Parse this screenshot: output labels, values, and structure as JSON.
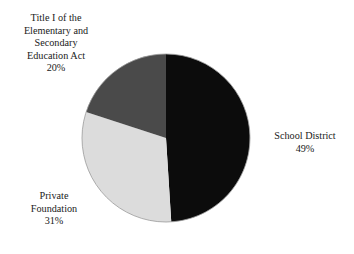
{
  "chart_data": {
    "type": "pie",
    "title": "",
    "subtitle": "",
    "xlabel": "",
    "ylabel": "",
    "legend_position": "none",
    "grid": false,
    "start_angle_deg": 0,
    "direction": "clockwise",
    "units": "percent",
    "categories": [
      "School District",
      "Private Foundation",
      "Title I of the Elementary and Secondary Education Act"
    ],
    "values": [
      49,
      31,
      20
    ],
    "slice_colors": [
      "#0c0c0c",
      "#dcdcdc",
      "#4a4a4a"
    ],
    "slices": [
      {
        "name": "School District",
        "value": 49,
        "value_label": "49%",
        "color": "#0c0c0c",
        "label_lines": [
          "School District"
        ]
      },
      {
        "name": "Private Foundation",
        "value": 31,
        "value_label": "31%",
        "color": "#dcdcdc",
        "label_lines": [
          "Private",
          "Foundation"
        ]
      },
      {
        "name": "Title I of the Elementary and Secondary Education Act",
        "value": 20,
        "value_label": "20%",
        "color": "#4a4a4a",
        "label_lines": [
          "Title I of the",
          "Elementary and",
          "Secondary",
          "Education Act"
        ]
      }
    ]
  },
  "labels": {
    "title1": {
      "line1": "Title I of the",
      "line2": "Elementary and",
      "line3": "Secondary",
      "line4": "Education Act",
      "percent": "20%"
    },
    "school_district": {
      "line1": "School District",
      "percent": "49%"
    },
    "private_foundation": {
      "line1": "Private",
      "line2": "Foundation",
      "percent": "31%"
    }
  },
  "style": {
    "background": "#ffffff",
    "text_color": "#1a1a1a",
    "outline_color": "#9a9a9a"
  }
}
